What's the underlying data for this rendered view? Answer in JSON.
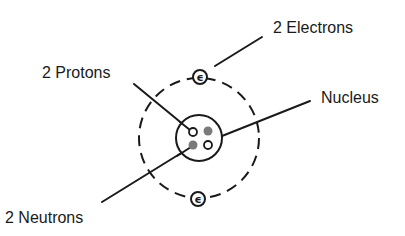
{
  "diagram": {
    "labels": {
      "electrons": "2 Electrons",
      "protons": "2 Protons",
      "nucleus": "Nucleus",
      "neutrons": "2 Neutrons"
    },
    "electron_symbol": "ϵ",
    "counts": {
      "electrons": 2,
      "protons": 2,
      "neutrons": 2
    },
    "colors": {
      "ink": "#1a1a1a",
      "proton_fill": "#ffffff",
      "neutron_fill": "#7a7a7a",
      "background": "#ffffff"
    }
  }
}
